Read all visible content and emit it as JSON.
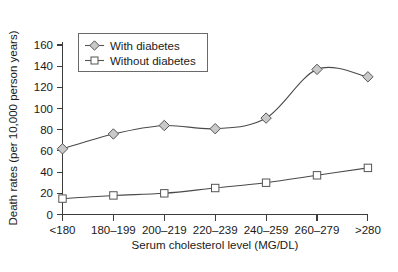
{
  "chart_data": {
    "type": "line",
    "title": "",
    "xlabel": "Serum cholesterol level (MG/DL)",
    "ylabel": "Death rates (per 10,000 person years)",
    "categories": [
      "<180",
      "180–199",
      "200–219",
      "220–239",
      "240–259",
      "260–279",
      ">280"
    ],
    "ylim": [
      0,
      160
    ],
    "yticks": [
      0,
      20,
      40,
      60,
      80,
      100,
      120,
      140,
      160
    ],
    "ytick_labels": [
      "0",
      "20",
      "40",
      "60",
      "80",
      "100",
      "120",
      "140",
      "160"
    ],
    "grid": false,
    "legend_position": "upper-left",
    "series": [
      {
        "name": "With diabetes",
        "marker": "diamond-filled",
        "color": "#c9c9c9",
        "line_color": "#4a4a4a",
        "values": [
          62,
          76,
          84,
          81,
          91,
          137,
          130
        ]
      },
      {
        "name": "Without diabetes",
        "marker": "square-open",
        "color": "#ffffff",
        "line_color": "#4a4a4a",
        "values": [
          15,
          18,
          20,
          25,
          30,
          37,
          44
        ]
      }
    ]
  },
  "legend": {
    "entries": [
      {
        "label": "With diabetes"
      },
      {
        "label": "Without diabetes"
      }
    ]
  },
  "axes": {
    "y_title": "Death rates (per 10,000 person years)",
    "x_title": "Serum cholesterol level (MG/DL)"
  }
}
